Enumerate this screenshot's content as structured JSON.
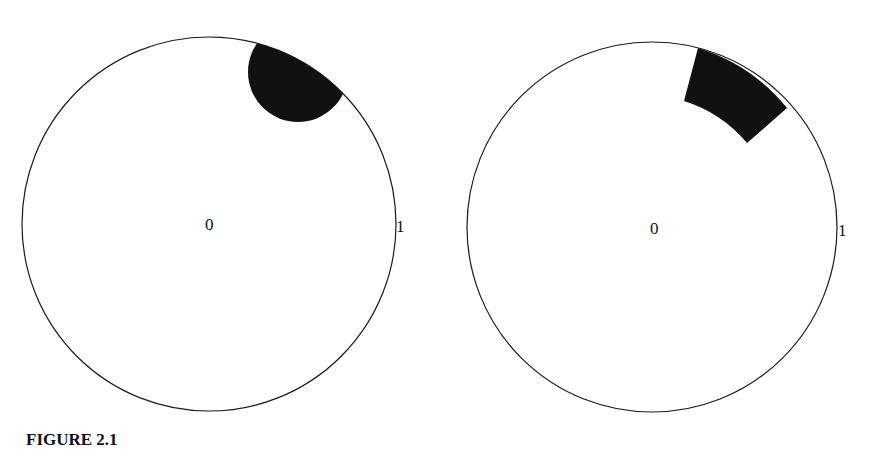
{
  "figure": {
    "caption": "FIGURE 2.1",
    "panels": [
      {
        "id": "left",
        "description": "Unit disk with a shaded disk-shaped neighborhood centered at a boundary point",
        "center_label": "0",
        "boundary_label": "1",
        "shaded_region": "disk neighborhood of a boundary point"
      },
      {
        "id": "right",
        "description": "Unit disk with a shaded annular sector (box) touching the boundary",
        "center_label": "0",
        "boundary_label": "1",
        "shaded_region": "annular sector (Carleson box) at the boundary"
      }
    ]
  },
  "colors": {
    "stroke": "#1a1a1a",
    "fill": "#111111",
    "background": "#ffffff"
  }
}
